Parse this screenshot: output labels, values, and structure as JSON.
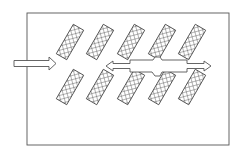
{
  "diagram": {
    "type": "schematic",
    "colors": {
      "stroke": "#555555",
      "background": "#ffffff",
      "hatch": "#444444"
    },
    "frame": {
      "x": 27,
      "y": 13,
      "width": 202,
      "height": 132
    },
    "inlet_arrow": {
      "direction": "right",
      "x1": 14,
      "y": 63,
      "x2": 56
    },
    "flow_arrow": {
      "direction": "both",
      "x1": 106,
      "x2": 211,
      "y": 66
    },
    "panel_rows": [
      {
        "row": "top",
        "count": 5,
        "centers_x": [
          70,
          100,
          131,
          162,
          192
        ],
        "center_y": 42
      },
      {
        "row": "bottom",
        "count": 5,
        "centers_x": [
          70,
          100,
          131,
          162,
          192
        ],
        "center_y": 87
      }
    ],
    "panel": {
      "width": 12,
      "height": 34,
      "rotation_deg": 30,
      "fill": "cross-hatch"
    }
  }
}
